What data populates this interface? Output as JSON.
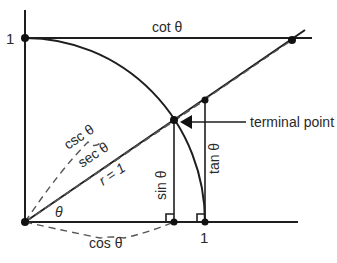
{
  "diagram": {
    "angle_label": "θ",
    "labels": {
      "y_one": "1",
      "x_one": "1",
      "cot": "cot θ",
      "csc": "csc θ",
      "sec": "sec θ",
      "radius": "r = 1",
      "sin": "sin θ",
      "tan": "tan θ",
      "cos": "cos θ",
      "theta": "θ",
      "terminal_point": "terminal point"
    },
    "colors": {
      "line": "#1e1e1e",
      "dashed": "#555555",
      "text": "#2a2a2a"
    }
  }
}
